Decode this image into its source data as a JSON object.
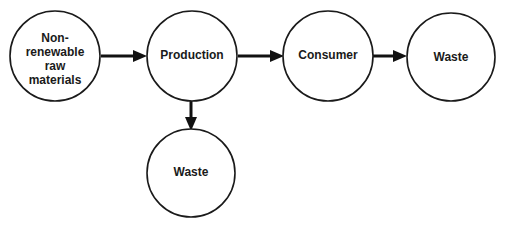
{
  "diagram": {
    "type": "flow",
    "nodes": [
      {
        "id": "raw",
        "label_lines": [
          "Non-",
          "renewable",
          "raw",
          "materials"
        ]
      },
      {
        "id": "production",
        "label_lines": [
          "Production"
        ]
      },
      {
        "id": "consumer",
        "label_lines": [
          "Consumer"
        ]
      },
      {
        "id": "waste1",
        "label_lines": [
          "Waste"
        ]
      },
      {
        "id": "waste2",
        "label_lines": [
          "Waste"
        ]
      }
    ],
    "edges": [
      {
        "from": "raw",
        "to": "production"
      },
      {
        "from": "production",
        "to": "consumer"
      },
      {
        "from": "consumer",
        "to": "waste1"
      },
      {
        "from": "production",
        "to": "waste2"
      }
    ],
    "colors": {
      "stroke": "#1a1a1a",
      "text": "#1a1a1a",
      "background": "#ffffff"
    }
  }
}
